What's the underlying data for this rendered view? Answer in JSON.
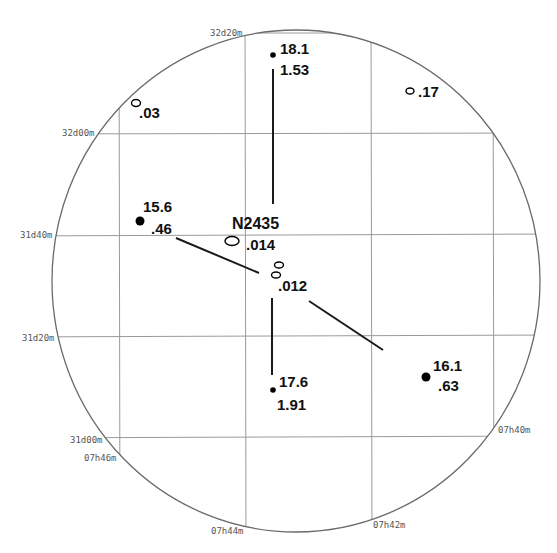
{
  "chart": {
    "cluster_name": "N2435",
    "dec_labels": [
      {
        "text": "32d20m",
        "x": 210,
        "y": 36
      },
      {
        "text": "32d00m",
        "x": 62,
        "y": 136
      },
      {
        "text": "31d40m",
        "x": 20,
        "y": 238
      },
      {
        "text": "31d20m",
        "x": 22,
        "y": 341
      },
      {
        "text": "31d00m",
        "x": 70,
        "y": 443
      }
    ],
    "ra_labels": [
      {
        "text": "07h46m",
        "x": 84,
        "y": 461
      },
      {
        "text": "07h44m",
        "x": 211,
        "y": 534
      },
      {
        "text": "07h42m",
        "x": 373,
        "y": 528
      },
      {
        "text": "07h40m",
        "x": 498,
        "y": 433
      }
    ],
    "stars": [
      {
        "id": "star-18-1",
        "type": "filled",
        "x": 273,
        "y": 55,
        "r": 2.8,
        "label1": "18.1",
        "label2": "1.53",
        "l1x": 280,
        "l1y": 54,
        "l2x": 280,
        "l2y": 75
      },
      {
        "id": "star-15-6",
        "type": "filled",
        "x": 140,
        "y": 221,
        "r": 4.5,
        "label1": "15.6",
        "label2": ".46",
        "l1x": 143,
        "l1y": 212,
        "l2x": 151,
        "l2y": 234
      },
      {
        "id": "star-17-6",
        "type": "filled",
        "x": 273,
        "y": 390,
        "r": 2.8,
        "label1": "17.6",
        "label2": "1.91",
        "l1x": 279,
        "l1y": 387,
        "l2x": 277,
        "l2y": 410
      },
      {
        "id": "star-16-1",
        "type": "filled",
        "x": 426,
        "y": 377,
        "r": 4.5,
        "label1": "16.1",
        "label2": ".63",
        "l1x": 433,
        "l1y": 371,
        "l2x": 438,
        "l2y": 391
      }
    ],
    "open_objects": [
      {
        "id": "obj-03",
        "x": 136,
        "y": 103,
        "rx": 4.5,
        "ry": 3.5,
        "label": ".03",
        "lx": 139,
        "ly": 118
      },
      {
        "id": "obj-17",
        "x": 410,
        "y": 91,
        "rx": 4,
        "ry": 3,
        "label": ".17",
        "lx": 418,
        "ly": 97
      },
      {
        "id": "obj-014",
        "x": 232,
        "y": 241,
        "rx": 7,
        "ry": 4.5,
        "label": ".014",
        "lx": 246,
        "ly": 250
      },
      {
        "id": "obj-012a",
        "x": 279,
        "y": 265,
        "rx": 4.5,
        "ry": 3,
        "label": "",
        "lx": 0,
        "ly": 0
      },
      {
        "id": "obj-012b",
        "x": 276,
        "y": 275,
        "rx": 4.5,
        "ry": 3,
        "label": ".012",
        "lx": 278,
        "ly": 291
      }
    ],
    "cluster_label_pos": {
      "x": 232,
      "y": 229
    },
    "vectors": [
      {
        "x1": 273,
        "y1": 69,
        "x2": 273,
        "y2": 204
      },
      {
        "x1": 272,
        "y1": 298,
        "x2": 272,
        "y2": 375
      },
      {
        "x1": 176,
        "y1": 238,
        "x2": 259,
        "y2": 273
      },
      {
        "x1": 309,
        "y1": 301,
        "x2": 383,
        "y2": 350
      }
    ],
    "field_circle": {
      "cx": 296,
      "cy": 281,
      "rx": 244,
      "ry": 251
    }
  }
}
